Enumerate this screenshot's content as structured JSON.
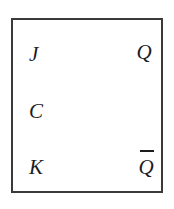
{
  "diagram": {
    "body": {
      "shape": "rectangle",
      "border_color": "#3a3a3c",
      "fill_color": "#ffffff"
    },
    "background_color": "#ffffff",
    "text_color": "#1c1c1e"
  },
  "pins": {
    "inputs": [
      {
        "id": "j",
        "label": "J",
        "side": "left",
        "role": "set-input"
      },
      {
        "id": "c",
        "label": "C",
        "side": "left",
        "role": "clock-input"
      },
      {
        "id": "k",
        "label": "K",
        "side": "left",
        "role": "reset-input"
      }
    ],
    "outputs": [
      {
        "id": "q",
        "label": "Q",
        "side": "right",
        "role": "output",
        "overline": false
      },
      {
        "id": "qbar",
        "label": "Q",
        "side": "right",
        "role": "complement-output",
        "overline": true
      }
    ]
  }
}
